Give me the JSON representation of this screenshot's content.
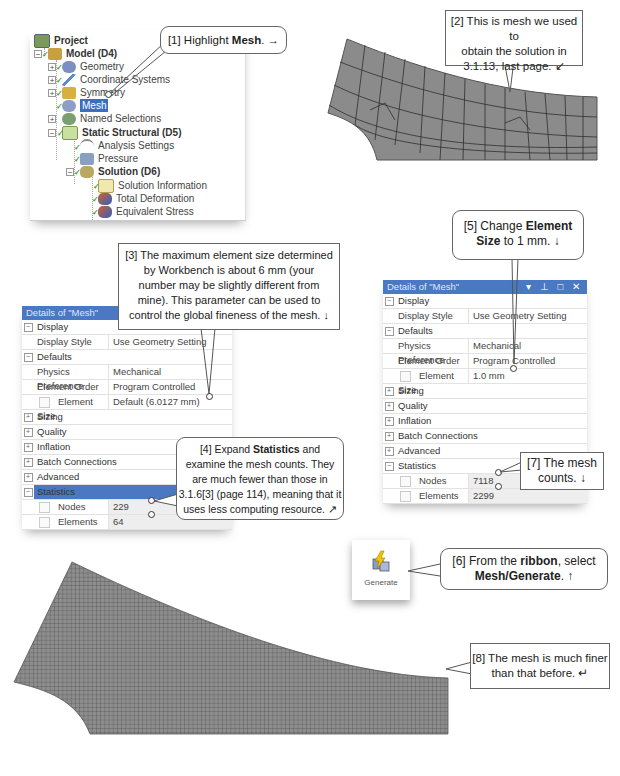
{
  "tree": {
    "items": [
      {
        "label": "Project",
        "level": 0,
        "bold": true
      },
      {
        "label": "Model (D4)",
        "level": 1,
        "bold": true,
        "expander": "−"
      },
      {
        "label": "Geometry",
        "level": 2,
        "expander": "+"
      },
      {
        "label": "Coordinate Systems",
        "level": 2,
        "expander": "+"
      },
      {
        "label": "Symmetry",
        "level": 2,
        "expander": "+"
      },
      {
        "label": "Mesh",
        "level": 2,
        "selected": true
      },
      {
        "label": "Named Selections",
        "level": 2,
        "expander": "+"
      },
      {
        "label": "Static Structural (D5)",
        "level": 2,
        "bold": true,
        "expander": "−"
      },
      {
        "label": "Analysis Settings",
        "level": 3
      },
      {
        "label": "Pressure",
        "level": 3
      },
      {
        "label": "Solution (D6)",
        "level": 3,
        "bold": true,
        "expander": "−"
      },
      {
        "label": "Solution Information",
        "level": 4
      },
      {
        "label": "Total Deformation",
        "level": 4
      },
      {
        "label": "Equivalent Stress",
        "level": 4
      }
    ]
  },
  "callouts": {
    "c1": {
      "prefix": "[1] Highlight ",
      "bold": "Mesh",
      "suffix": ". →"
    },
    "c2": {
      "line1": "[2] This is mesh we used to",
      "line2": "obtain the solution in",
      "line3": "3.1.13, last page.  ↙"
    },
    "c3": {
      "line1": "[3] The maximum element size determined",
      "line2": "by Workbench is about 6 mm (your",
      "line3": "number may be slightly different from",
      "line4": "mine). This parameter can be used to",
      "line5": "control the global fineness of the mesh.  ↓"
    },
    "c4": {
      "prefix": "[4] Expand ",
      "bold": "Statistics",
      "suffix": " and",
      "line2": "examine the mesh counts. They",
      "line3": "are much fewer than those in",
      "line4": "3.1.6[3] (page 114), meaning that it",
      "line5": "uses less computing resource.  ↗"
    },
    "c5": {
      "prefix": "[5] Change ",
      "bold1": "Element",
      "bold2": "Size",
      "suffix": " to 1 mm.  ↓"
    },
    "c6": {
      "prefix": "[6] From the ",
      "bold1": "ribbon",
      "mid": ", select",
      "bold2": "Mesh/Generate",
      "suffix": ".  ↑"
    },
    "c7": {
      "line1": "[7] The mesh",
      "line2": "counts.  ↓"
    },
    "c8": {
      "line1": "[8] The mesh is much finer",
      "line2": "than that before.  ↵"
    }
  },
  "details_left": {
    "title": "Details of \"Mesh\"",
    "rows": [
      {
        "type": "section",
        "name": "Display",
        "toggle": "−"
      },
      {
        "type": "prop",
        "name": "Display Style",
        "value": "Use Geometry Setting"
      },
      {
        "type": "section",
        "name": "Defaults",
        "toggle": "−"
      },
      {
        "type": "prop",
        "name": "Physics Preference",
        "value": "Mechanical"
      },
      {
        "type": "prop",
        "name": "Element Order",
        "value": "Program Controlled"
      },
      {
        "type": "prop-cb",
        "name": "Element Size",
        "value": "Default (6.0127 mm)"
      },
      {
        "type": "section",
        "name": "Sizing",
        "toggle": "+"
      },
      {
        "type": "section",
        "name": "Quality",
        "toggle": "+"
      },
      {
        "type": "section",
        "name": "Inflation",
        "toggle": "+"
      },
      {
        "type": "section",
        "name": "Batch Connections",
        "toggle": "+"
      },
      {
        "type": "section",
        "name": "Advanced",
        "toggle": "+"
      },
      {
        "type": "section-hl",
        "name": "Statistics",
        "toggle": "−"
      },
      {
        "type": "prop-cb-ro",
        "name": "Nodes",
        "value": "229"
      },
      {
        "type": "prop-cb-ro",
        "name": "Elements",
        "value": "64"
      }
    ]
  },
  "details_right": {
    "title": "Details of \"Mesh\"",
    "window_buttons": "▾ ⊥ □ ✕",
    "rows": [
      {
        "type": "section",
        "name": "Display",
        "toggle": "−"
      },
      {
        "type": "prop",
        "name": "Display Style",
        "value": "Use Geometry Setting"
      },
      {
        "type": "section",
        "name": "Defaults",
        "toggle": "−"
      },
      {
        "type": "prop",
        "name": "Physics Preference",
        "value": "Mechanical"
      },
      {
        "type": "prop",
        "name": "Element Order",
        "value": "Program Controlled"
      },
      {
        "type": "prop-cb",
        "name": "Element Size",
        "value": "1.0 mm"
      },
      {
        "type": "section",
        "name": "Sizing",
        "toggle": "+"
      },
      {
        "type": "section",
        "name": "Quality",
        "toggle": "+"
      },
      {
        "type": "section",
        "name": "Inflation",
        "toggle": "+"
      },
      {
        "type": "section",
        "name": "Batch Connections",
        "toggle": "+"
      },
      {
        "type": "section",
        "name": "Advanced",
        "toggle": "+"
      },
      {
        "type": "section",
        "name": "Statistics",
        "toggle": "−"
      },
      {
        "type": "prop-cb-ro",
        "name": "Nodes",
        "value": "7118"
      },
      {
        "type": "prop-cb-ro",
        "name": "Elements",
        "value": "2299"
      }
    ]
  },
  "ribbon": {
    "generate_label": "Generate"
  },
  "colors": {
    "accent": "#4a78c2",
    "mesh_fill": "#8a8a8a",
    "mesh_line": "#333333"
  }
}
